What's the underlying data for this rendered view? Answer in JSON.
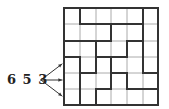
{
  "label": "6 5 3",
  "grid": {
    "rows": 6,
    "cols": 6,
    "xs": [
      64,
      80,
      96,
      111,
      127,
      143,
      158
    ],
    "ys": [
      8,
      24,
      41,
      57,
      73,
      89,
      105
    ],
    "thin_color": "#aaaaaa",
    "thick_color": "#333333",
    "thick_vertical": [
      [
        1,
        0,
        1
      ],
      [
        1,
        3,
        6
      ],
      [
        5,
        0,
        4
      ],
      [
        3,
        1,
        2
      ],
      [
        3,
        3,
        5
      ],
      [
        2,
        2,
        4
      ],
      [
        2,
        5,
        6
      ],
      [
        4,
        2,
        3
      ],
      [
        4,
        4,
        5
      ]
    ],
    "thick_horizontal": [
      [
        1,
        1,
        5
      ],
      [
        2,
        0,
        3
      ],
      [
        2,
        4,
        5
      ],
      [
        3,
        0,
        1
      ],
      [
        3,
        2,
        4
      ],
      [
        4,
        1,
        2
      ],
      [
        4,
        3,
        4
      ],
      [
        4,
        5,
        6
      ],
      [
        5,
        2,
        3
      ],
      [
        5,
        4,
        6
      ]
    ]
  },
  "arrows": {
    "origin": [
      41,
      80
    ],
    "targets": [
      [
        62,
        64
      ],
      [
        62,
        80
      ],
      [
        62,
        96
      ]
    ]
  }
}
